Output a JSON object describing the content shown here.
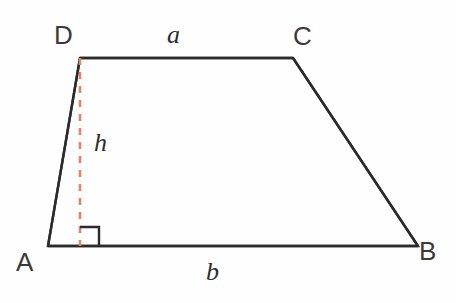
{
  "figure": {
    "type": "geometry-diagram",
    "shape": "trapezoid",
    "background_color": "#fefefe",
    "stroke_color": "#2b2b2b",
    "height_line_color": "#e8836a",
    "labels": {
      "vertex_a": "A",
      "vertex_b": "B",
      "vertex_c": "C",
      "vertex_d": "D",
      "side_top": "a",
      "side_bottom": "b",
      "height": "h"
    },
    "vertices": {
      "A": {
        "x": 48,
        "y": 246
      },
      "B": {
        "x": 418,
        "y": 246
      },
      "C": {
        "x": 293,
        "y": 58
      },
      "D": {
        "x": 80,
        "y": 58
      }
    },
    "height_segment": {
      "from": {
        "x": 80,
        "y": 58
      },
      "to": {
        "x": 80,
        "y": 246
      },
      "style": "dashed"
    },
    "right_angle_marker": {
      "x": 80,
      "y": 246,
      "size": 19,
      "direction": "up-right"
    }
  }
}
